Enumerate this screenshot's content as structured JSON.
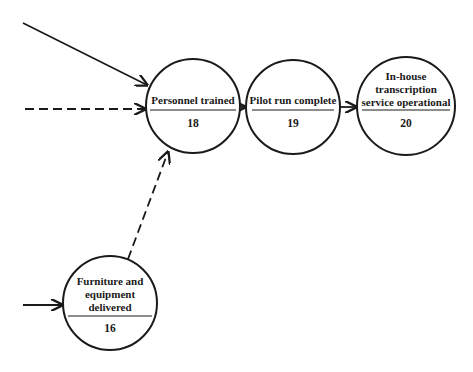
{
  "nodes": [
    {
      "id": "18",
      "label_lines": [
        "Personnel trained"
      ],
      "number": "18",
      "cx": 193,
      "cy": 106,
      "r": 47
    },
    {
      "id": "19",
      "label_lines": [
        "Pilot run complete"
      ],
      "number": "19",
      "cx": 293,
      "cy": 107,
      "r": 47
    },
    {
      "id": "20",
      "label_lines": [
        "In-house",
        "transcription",
        "service operational"
      ],
      "number": "20",
      "cx": 406,
      "cy": 106,
      "r": 49
    },
    {
      "id": "16",
      "label_lines": [
        "Furniture and",
        "equipment",
        "delivered"
      ],
      "number": "16",
      "cx": 110,
      "cy": 303,
      "r": 47
    }
  ],
  "edges": [
    {
      "from": "external",
      "to": "18",
      "style": "solid",
      "x1": 23,
      "y1": 23,
      "x2": 147,
      "y2": 85
    },
    {
      "from": "external",
      "to": "18",
      "style": "dashed",
      "x1": 25,
      "y1": 109,
      "x2": 146,
      "y2": 109
    },
    {
      "from": "16",
      "to": "18",
      "style": "dashed",
      "x1": 128,
      "y1": 259,
      "x2": 168,
      "y2": 150
    },
    {
      "from": "18",
      "to": "19",
      "style": "solid",
      "x1": 240,
      "y1": 107,
      "x2": 246,
      "y2": 107
    },
    {
      "from": "19",
      "to": "20",
      "style": "solid",
      "x1": 340,
      "y1": 107,
      "x2": 357,
      "y2": 107
    },
    {
      "from": "external",
      "to": "16",
      "style": "solid",
      "x1": 23,
      "y1": 305,
      "x2": 63,
      "y2": 305
    }
  ],
  "colors": {
    "stroke": "#1a1a1a",
    "background": "#ffffff"
  }
}
